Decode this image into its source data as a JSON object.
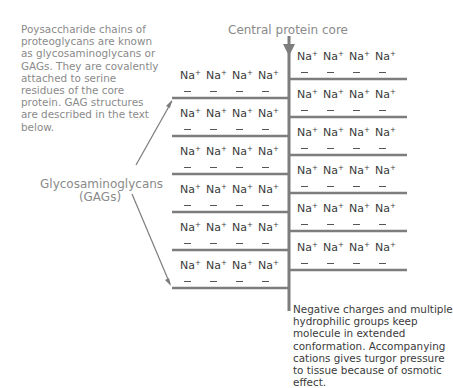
{
  "intro_note": "Poysaccharide chains of proteoglycans are known as glycosaminoglycans or GAGs. They are covalently attached to serine residues of the core protein. GAG structures are described in the text below.",
  "core_label": "Central protein core",
  "gag_label_line1": "Glycosaminoglycans",
  "gag_label_line2": "(GAGs)",
  "bottom_note": "Negative charges and multiple hydrophilic groups keep molecule in extended conformation. Accompanying cations gives turgor pressure to tissue because of osmotic effect.",
  "ion": {
    "symbol": "Na",
    "charge": "+",
    "negative": "–"
  },
  "structure": {
    "left_chains": 6,
    "right_chains": 6,
    "ions_per_chain": 4,
    "colors": {
      "line": "#7d7d7d",
      "text_light": "#8a8a8a",
      "text_dark": "#3a3a3a"
    }
  }
}
